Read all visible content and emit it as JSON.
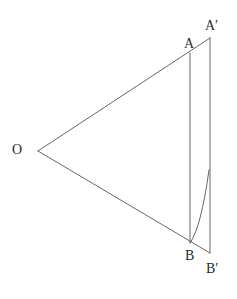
{
  "figure": {
    "type": "geometric-diagram",
    "background_color": "#ffffff",
    "line_color": "#555555",
    "label_color": "#2b2b2b",
    "canvas": {
      "width": 237,
      "height": 299
    },
    "points": [
      {
        "id": "O",
        "label": "O",
        "x": 38,
        "y": 151
      },
      {
        "id": "A",
        "label": "A",
        "x": 190,
        "y": 53
      },
      {
        "id": "Ap",
        "label": "A′",
        "x": 210,
        "y": 38
      },
      {
        "id": "B",
        "label": "B",
        "x": 190,
        "y": 243
      },
      {
        "id": "Bp",
        "label": "B′",
        "x": 210,
        "y": 253
      }
    ],
    "segments": [
      {
        "id": "ray-upper",
        "from": "O",
        "to": "Ap",
        "style": "solid"
      },
      {
        "id": "ray-lower",
        "from": "O",
        "to": "Bp",
        "style": "solid"
      },
      {
        "id": "chord-AB",
        "from": "A",
        "to": "B",
        "style": "solid"
      },
      {
        "id": "chord-ApBp",
        "from": "Ap",
        "to": "Bp",
        "style": "solid"
      }
    ],
    "curves": [
      {
        "id": "arc-B-to-ApBp",
        "description": "concave curve from B rising to meet the A'B' vertical line",
        "start": {
          "x": 190,
          "y": 243
        },
        "control": {
          "x": 201,
          "y": 228
        },
        "end": {
          "x": 209,
          "y": 170
        }
      }
    ],
    "labels": {
      "O": "O",
      "A": "A",
      "A_prime": "A′",
      "B": "B",
      "B_prime": "B′"
    }
  }
}
